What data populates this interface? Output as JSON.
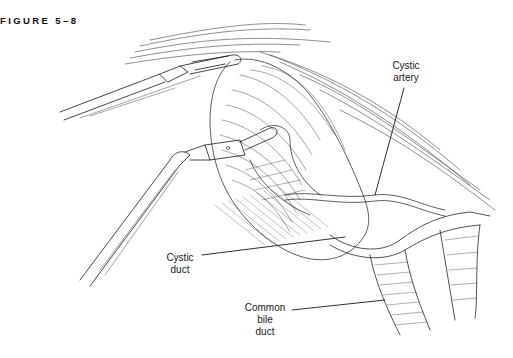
{
  "figure": {
    "title": "FIGURE 5–8"
  },
  "labels": {
    "cystic_artery": [
      "Cystic",
      "artery"
    ],
    "cystic_duct": [
      "Cystic",
      "duct"
    ],
    "common_bile_duct": [
      "Common",
      "bile",
      "duct"
    ]
  },
  "colors": {
    "ink": "#1a1a1a",
    "background": "#ffffff"
  }
}
